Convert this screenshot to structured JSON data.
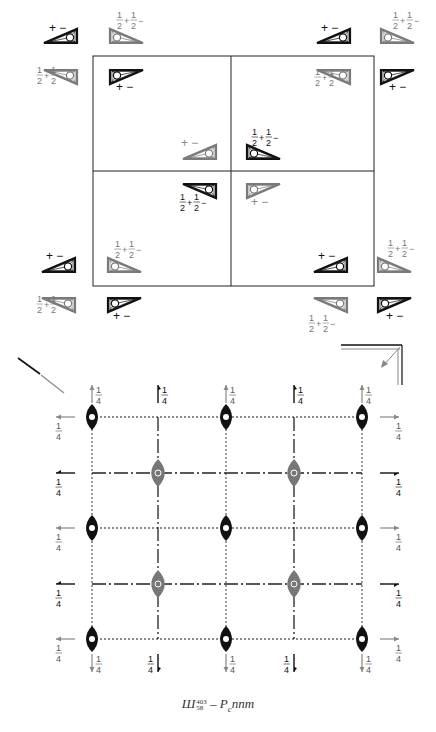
{
  "figure": {
    "caption": {
      "prefix": "Ш",
      "sup": "403",
      "sub": "58",
      "dash": " – ",
      "symbol_main": "P",
      "symbol_sub": "c",
      "symbol_rest": "nnm"
    },
    "colors": {
      "black": "#111111",
      "gray": "#7a7a7a",
      "line": "#222222"
    },
    "top_panel": {
      "description": "Equivalent positions diagram with signed triangles",
      "labels": {
        "plus_minus": "+ −",
        "half_plus_half_minus": "½+½−"
      },
      "frame": {
        "x": 93,
        "y": 55,
        "w": 190,
        "h": 232
      },
      "groups": [
        {
          "name": "top-left",
          "cx": 93,
          "cy": 55
        },
        {
          "name": "top-right",
          "cx": 375,
          "cy": 55
        },
        {
          "name": "center",
          "cx": 230,
          "cy": 170
        },
        {
          "name": "bottom-left",
          "cx": 93,
          "cy": 285
        },
        {
          "name": "bottom-right",
          "cx": 375,
          "cy": 285
        }
      ]
    },
    "bottom_panel": {
      "description": "Symmetry elements diagram",
      "fraction_label": "1/4",
      "frac_num": "1",
      "frac_den": "4",
      "grid": {
        "x": [
          92,
          158,
          226,
          294,
          362
        ],
        "y": [
          417,
          473,
          528,
          584,
          639
        ]
      }
    }
  }
}
